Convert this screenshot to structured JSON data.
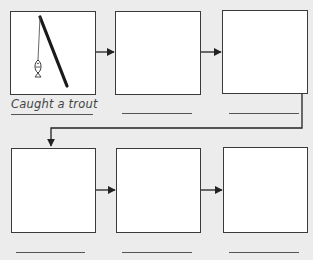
{
  "diagram": {
    "type": "sequence-flow-chart",
    "rows": 2,
    "columns": 3,
    "boxes": [
      {
        "index": 1,
        "row": 1,
        "col": 1,
        "icon": "fishing-rod-with-fish-icon",
        "caption": "Caught a trout"
      },
      {
        "index": 2,
        "row": 1,
        "col": 2,
        "icon": "",
        "caption": ""
      },
      {
        "index": 3,
        "row": 1,
        "col": 3,
        "icon": "",
        "caption": ""
      },
      {
        "index": 4,
        "row": 2,
        "col": 1,
        "icon": "",
        "caption": ""
      },
      {
        "index": 5,
        "row": 2,
        "col": 2,
        "icon": "",
        "caption": ""
      },
      {
        "index": 6,
        "row": 2,
        "col": 3,
        "icon": "",
        "caption": ""
      }
    ],
    "colors": {
      "background": "#ececec",
      "box_fill": "#ffffff",
      "stroke": "#3a3a3a"
    }
  }
}
